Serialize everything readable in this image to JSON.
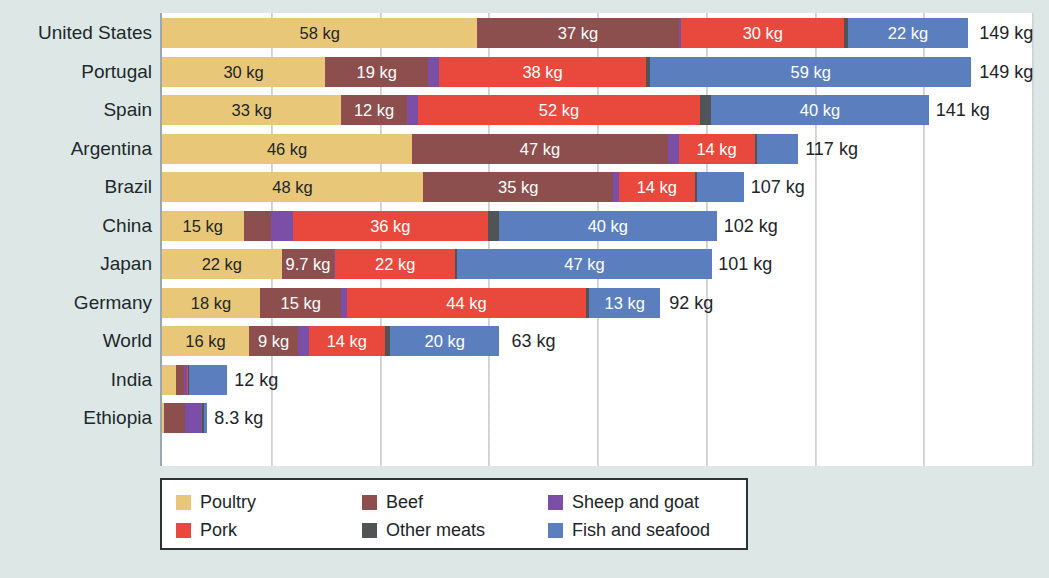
{
  "chart_data": {
    "type": "bar",
    "orientation": "horizontal",
    "stacked": true,
    "title": "",
    "subtitle": "",
    "xlabel": "",
    "ylabel": "",
    "unit": "kg",
    "xlim": [
      0,
      160
    ],
    "grid": true,
    "gridline_values": [
      20,
      40,
      60,
      80,
      100,
      120,
      140,
      160
    ],
    "legend_position": "bottom-left",
    "legend": [
      {
        "name": "Poultry",
        "color": "#e8c878"
      },
      {
        "name": "Beef",
        "color": "#8c4f4e"
      },
      {
        "name": "Sheep and goat",
        "color": "#7b4ea8"
      },
      {
        "name": "Pork",
        "color": "#e8493c"
      },
      {
        "name": "Other meats",
        "color": "#4f5557"
      },
      {
        "name": "Fish and seafood",
        "color": "#5b7fbe"
      }
    ],
    "series": [
      {
        "name": "Poultry",
        "color": "#e8c878",
        "label_color": "#1d2529"
      },
      {
        "name": "Beef",
        "color": "#8c4f4e",
        "label_color": "#ffffff"
      },
      {
        "name": "Sheep and goat",
        "color": "#7b4ea8",
        "label_color": "#ffffff"
      },
      {
        "name": "Pork",
        "color": "#e8493c",
        "label_color": "#ffffff"
      },
      {
        "name": "Other meats",
        "color": "#4f5557",
        "label_color": "#ffffff"
      },
      {
        "name": "Fish and seafood",
        "color": "#5b7fbe",
        "label_color": "#ffffff"
      }
    ],
    "categories": [
      "United States",
      "Portugal",
      "Spain",
      "Argentina",
      "Brazil",
      "China",
      "Japan",
      "Germany",
      "World",
      "India",
      "Ethiopia"
    ],
    "rows": [
      {
        "country": "United States",
        "total": 149,
        "total_label": "149 kg",
        "segments": [
          {
            "series": "Poultry",
            "value": 58,
            "label": "58 kg"
          },
          {
            "series": "Beef",
            "value": 37,
            "label": "37 kg"
          },
          {
            "series": "Sheep and goat",
            "value": 0.5,
            "label": ""
          },
          {
            "series": "Pork",
            "value": 30,
            "label": "30 kg"
          },
          {
            "series": "Other meats",
            "value": 0.7,
            "label": ""
          },
          {
            "series": "Fish and seafood",
            "value": 22,
            "label": "22 kg"
          }
        ]
      },
      {
        "country": "Portugal",
        "total": 149,
        "total_label": "149 kg",
        "segments": [
          {
            "series": "Poultry",
            "value": 30,
            "label": "30 kg"
          },
          {
            "series": "Beef",
            "value": 19,
            "label": "19 kg"
          },
          {
            "series": "Sheep and goat",
            "value": 2.0,
            "label": ""
          },
          {
            "series": "Pork",
            "value": 38,
            "label": "38 kg"
          },
          {
            "series": "Other meats",
            "value": 0.8,
            "label": ""
          },
          {
            "series": "Fish and seafood",
            "value": 59,
            "label": "59 kg"
          }
        ]
      },
      {
        "country": "Spain",
        "total": 141,
        "total_label": "141 kg",
        "segments": [
          {
            "series": "Poultry",
            "value": 33,
            "label": "33 kg"
          },
          {
            "series": "Beef",
            "value": 12,
            "label": "12 kg"
          },
          {
            "series": "Sheep and goat",
            "value": 2.0,
            "label": ""
          },
          {
            "series": "Pork",
            "value": 52,
            "label": "52 kg"
          },
          {
            "series": "Other meats",
            "value": 2.0,
            "label": ""
          },
          {
            "series": "Fish and seafood",
            "value": 40,
            "label": "40 kg"
          }
        ]
      },
      {
        "country": "Argentina",
        "total": 117,
        "total_label": "117 kg",
        "segments": [
          {
            "series": "Poultry",
            "value": 46,
            "label": "46 kg"
          },
          {
            "series": "Beef",
            "value": 47,
            "label": "47 kg"
          },
          {
            "series": "Sheep and goat",
            "value": 2.0,
            "label": ""
          },
          {
            "series": "Pork",
            "value": 14,
            "label": "14 kg"
          },
          {
            "series": "Other meats",
            "value": 0.5,
            "label": ""
          },
          {
            "series": "Fish and seafood",
            "value": 7.5,
            "label": ""
          }
        ]
      },
      {
        "country": "Brazil",
        "total": 107,
        "total_label": "107 kg",
        "segments": [
          {
            "series": "Poultry",
            "value": 48,
            "label": "48 kg"
          },
          {
            "series": "Beef",
            "value": 35,
            "label": "35 kg"
          },
          {
            "series": "Sheep and goat",
            "value": 1.0,
            "label": ""
          },
          {
            "series": "Pork",
            "value": 14,
            "label": "14 kg"
          },
          {
            "series": "Other meats",
            "value": 0.4,
            "label": ""
          },
          {
            "series": "Fish and seafood",
            "value": 8.6,
            "label": ""
          }
        ]
      },
      {
        "country": "China",
        "total": 102,
        "total_label": "102 kg",
        "segments": [
          {
            "series": "Poultry",
            "value": 15,
            "label": "15 kg"
          },
          {
            "series": "Beef",
            "value": 5.0,
            "label": ""
          },
          {
            "series": "Sheep and goat",
            "value": 4.0,
            "label": ""
          },
          {
            "series": "Pork",
            "value": 36,
            "label": "36 kg"
          },
          {
            "series": "Other meats",
            "value": 2.0,
            "label": ""
          },
          {
            "series": "Fish and seafood",
            "value": 40,
            "label": "40 kg"
          }
        ]
      },
      {
        "country": "Japan",
        "total": 101,
        "total_label": "101 kg",
        "segments": [
          {
            "series": "Poultry",
            "value": 22,
            "label": "22 kg"
          },
          {
            "series": "Beef",
            "value": 9.7,
            "label": "9.7 kg"
          },
          {
            "series": "Sheep and goat",
            "value": 0.2,
            "label": ""
          },
          {
            "series": "Pork",
            "value": 22,
            "label": "22 kg"
          },
          {
            "series": "Other meats",
            "value": 0.3,
            "label": ""
          },
          {
            "series": "Fish and seafood",
            "value": 47,
            "label": "47 kg"
          }
        ]
      },
      {
        "country": "Germany",
        "total": 92,
        "total_label": "92 kg",
        "segments": [
          {
            "series": "Poultry",
            "value": 18,
            "label": "18 kg"
          },
          {
            "series": "Beef",
            "value": 15,
            "label": "15 kg"
          },
          {
            "series": "Sheep and goat",
            "value": 1.0,
            "label": ""
          },
          {
            "series": "Pork",
            "value": 44,
            "label": "44 kg"
          },
          {
            "series": "Other meats",
            "value": 0.6,
            "label": ""
          },
          {
            "series": "Fish and seafood",
            "value": 13,
            "label": "13 kg"
          }
        ]
      },
      {
        "country": "World",
        "total": 63,
        "total_label": "63 kg",
        "segments": [
          {
            "series": "Poultry",
            "value": 16,
            "label": "16 kg"
          },
          {
            "series": "Beef",
            "value": 9,
            "label": "9 kg"
          },
          {
            "series": "Sheep and goat",
            "value": 2.0,
            "label": ""
          },
          {
            "series": "Pork",
            "value": 14,
            "label": "14 kg"
          },
          {
            "series": "Other meats",
            "value": 1.0,
            "label": ""
          },
          {
            "series": "Fish and seafood",
            "value": 20,
            "label": "20 kg"
          }
        ]
      },
      {
        "country": "India",
        "total": 12,
        "total_label": "12 kg",
        "segments": [
          {
            "series": "Poultry",
            "value": 2.5,
            "label": ""
          },
          {
            "series": "Beef",
            "value": 1.5,
            "label": ""
          },
          {
            "series": "Sheep and goat",
            "value": 0.6,
            "label": ""
          },
          {
            "series": "Pork",
            "value": 0.2,
            "label": ""
          },
          {
            "series": "Other meats",
            "value": 0.2,
            "label": ""
          },
          {
            "series": "Fish and seafood",
            "value": 7.0,
            "label": ""
          }
        ]
      },
      {
        "country": "Ethiopia",
        "total": 8.3,
        "total_label": "8.3 kg",
        "segments": [
          {
            "series": "Poultry",
            "value": 0.3,
            "label": ""
          },
          {
            "series": "Beef",
            "value": 4.0,
            "label": ""
          },
          {
            "series": "Sheep and goat",
            "value": 3.0,
            "label": ""
          },
          {
            "series": "Pork",
            "value": 0.1,
            "label": ""
          },
          {
            "series": "Other meats",
            "value": 0.4,
            "label": ""
          },
          {
            "series": "Fish and seafood",
            "value": 0.5,
            "label": ""
          }
        ]
      }
    ]
  },
  "colors": {
    "background": "#dde8e6",
    "plot_background": "#ffffff",
    "axis": "#9aa8ad",
    "grid": "#d3d3d3",
    "text": "#1d2529",
    "legend_border": "#2b3338"
  }
}
